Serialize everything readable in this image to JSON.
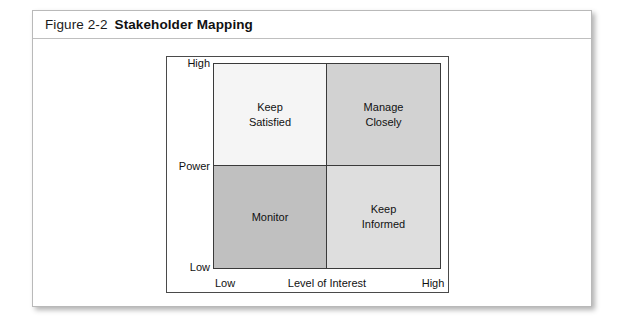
{
  "page": {
    "background_color": "#ffffff",
    "card_border_color": "#b9b9b9"
  },
  "header": {
    "figure_number": "Figure 2-2",
    "title": "Stakeholder Mapping"
  },
  "chart_data": {
    "type": "table",
    "title": "Stakeholder Mapping",
    "xlabel": "Level of Interest",
    "ylabel": "Power",
    "xtick_labels": [
      "Low",
      "High"
    ],
    "ytick_labels": [
      "Low",
      "High"
    ],
    "grid": false,
    "legend": "none",
    "quadrants": [
      {
        "id": "keep-satisfied",
        "label": "Keep\nSatisfied",
        "power": "High",
        "interest": "Low",
        "position": "top-left",
        "fill": "#f5f5f5"
      },
      {
        "id": "manage-closely",
        "label": "Manage\nClosely",
        "power": "High",
        "interest": "High",
        "position": "top-right",
        "fill": "#d2d2d2"
      },
      {
        "id": "monitor",
        "label": "Monitor",
        "power": "Low",
        "interest": "Low",
        "position": "bottom-left",
        "fill": "#c0c0c0"
      },
      {
        "id": "keep-informed",
        "label": "Keep\nInformed",
        "power": "Low",
        "interest": "High",
        "position": "bottom-right",
        "fill": "#dedede"
      }
    ]
  },
  "axes": {
    "y": {
      "name": "Power",
      "high": "High",
      "low": "Low"
    },
    "x": {
      "name": "Level of Interest",
      "low": "Low",
      "high": "High"
    }
  }
}
